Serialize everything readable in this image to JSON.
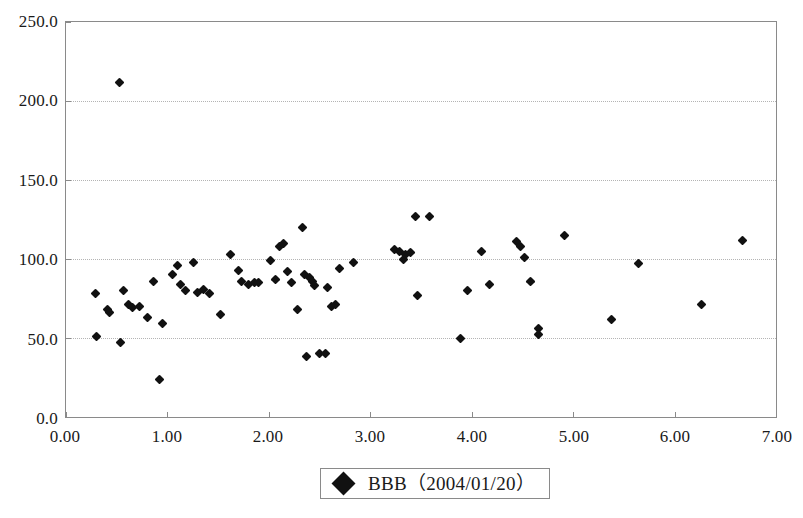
{
  "chart_data": {
    "type": "scatter",
    "title": "",
    "xlabel": "",
    "ylabel": "",
    "xlim": [
      0.0,
      7.0
    ],
    "ylim": [
      0.0,
      250.0
    ],
    "xticks": [
      0.0,
      1.0,
      2.0,
      3.0,
      4.0,
      5.0,
      6.0,
      7.0
    ],
    "yticks": [
      0.0,
      50.0,
      100.0,
      150.0,
      200.0,
      250.0
    ],
    "xtick_labels": [
      "0.00",
      "1.00",
      "2.00",
      "3.00",
      "4.00",
      "5.00",
      "6.00",
      "7.00"
    ],
    "ytick_labels": [
      "0.0",
      "50.0",
      "100.0",
      "150.0",
      "200.0",
      "250.0"
    ],
    "grid": "horizontal-dotted",
    "legend_position": "bottom-center",
    "marker": "diamond",
    "marker_color": "#111111",
    "series": [
      {
        "name": "BBB (2004/01/20)",
        "points": [
          [
            0.29,
            78
          ],
          [
            0.3,
            51
          ],
          [
            0.41,
            68
          ],
          [
            0.43,
            66
          ],
          [
            0.53,
            212
          ],
          [
            0.54,
            47
          ],
          [
            0.57,
            80
          ],
          [
            0.62,
            71
          ],
          [
            0.66,
            69
          ],
          [
            0.72,
            70
          ],
          [
            0.8,
            63
          ],
          [
            0.86,
            86
          ],
          [
            0.92,
            24
          ],
          [
            0.95,
            59
          ],
          [
            1.05,
            90
          ],
          [
            1.1,
            96
          ],
          [
            1.13,
            84
          ],
          [
            1.18,
            80
          ],
          [
            1.26,
            98
          ],
          [
            1.3,
            79
          ],
          [
            1.36,
            81
          ],
          [
            1.41,
            78
          ],
          [
            1.52,
            65
          ],
          [
            1.62,
            103
          ],
          [
            1.7,
            93
          ],
          [
            1.73,
            86
          ],
          [
            1.8,
            84
          ],
          [
            1.86,
            85
          ],
          [
            1.9,
            85
          ],
          [
            2.02,
            99
          ],
          [
            2.07,
            87
          ],
          [
            2.1,
            108
          ],
          [
            2.14,
            110
          ],
          [
            2.18,
            92
          ],
          [
            2.22,
            85
          ],
          [
            2.28,
            68
          ],
          [
            2.33,
            120
          ],
          [
            2.35,
            90
          ],
          [
            2.37,
            38
          ],
          [
            2.4,
            88
          ],
          [
            2.43,
            86
          ],
          [
            2.45,
            83
          ],
          [
            2.5,
            40
          ],
          [
            2.56,
            40
          ],
          [
            2.58,
            82
          ],
          [
            2.62,
            70
          ],
          [
            2.66,
            71
          ],
          [
            2.7,
            94
          ],
          [
            2.83,
            98
          ],
          [
            3.24,
            106
          ],
          [
            3.29,
            105
          ],
          [
            3.33,
            100
          ],
          [
            3.35,
            103
          ],
          [
            3.4,
            104
          ],
          [
            3.45,
            127
          ],
          [
            3.47,
            77
          ],
          [
            3.58,
            127
          ],
          [
            3.89,
            50
          ],
          [
            3.96,
            80
          ],
          [
            4.1,
            105
          ],
          [
            4.18,
            84
          ],
          [
            4.44,
            111
          ],
          [
            4.48,
            108
          ],
          [
            4.52,
            101
          ],
          [
            4.58,
            86
          ],
          [
            4.66,
            56
          ],
          [
            4.66,
            52
          ],
          [
            4.91,
            115
          ],
          [
            5.38,
            62
          ],
          [
            5.64,
            97
          ],
          [
            6.27,
            71
          ],
          [
            6.67,
            112
          ]
        ]
      }
    ]
  },
  "legend": {
    "marker_name": "diamond-marker",
    "label": "BBB（2004/01/20）"
  }
}
